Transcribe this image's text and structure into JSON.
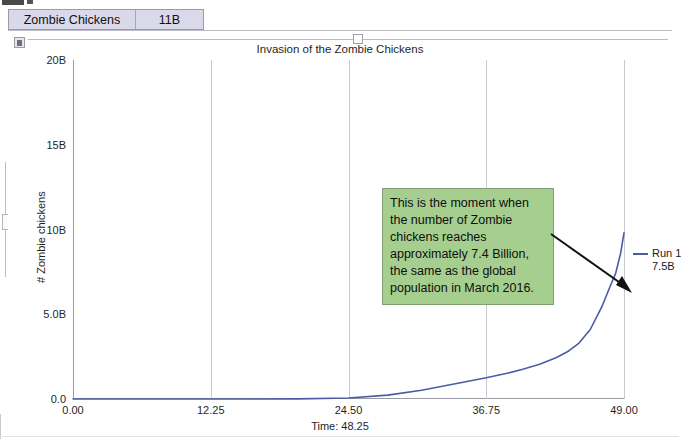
{
  "window": {
    "tabs": [
      {
        "label": "Zombie Chickens",
        "name": "tab-zombie-chickens"
      },
      {
        "label": "11B",
        "name": "tab-11b"
      }
    ]
  },
  "panel": {
    "icon": "window-restore-icon",
    "slider": {
      "name": "horizontal-slider",
      "thumb_position_pct": 50
    },
    "vscroll": {
      "name": "vertical-scrollbar"
    }
  },
  "legend": {
    "series_label": "Run 1",
    "value_label": "7.5B",
    "color": "#4b5ca6"
  },
  "annotation": {
    "text": "This is the moment when the number of Zombie chickens reaches approximately 7.4 Billion, the same as the global population in March 2016.",
    "background": "#a6cf8f",
    "border": "#7f9f72"
  },
  "chart_data": {
    "type": "line",
    "title": "Invasion of the Zombie Chickens",
    "xlabel": "Time: 48.25",
    "ylabel": "# Zombie chickens",
    "xlim": [
      0.0,
      49.0
    ],
    "ylim": [
      0.0,
      20000000000
    ],
    "grid": "vertical-only",
    "legend_position": "right-outside",
    "xticks": [
      "0.00",
      "12.25",
      "24.50",
      "36.75",
      "49.00"
    ],
    "xtick_values": [
      0.0,
      12.25,
      24.5,
      36.75,
      49.0
    ],
    "yticks": [
      "0.0",
      "5.0B",
      "10B",
      "15B",
      "20B"
    ],
    "ytick_values": [
      0,
      5000000000,
      10000000000,
      15000000000,
      20000000000
    ],
    "series": [
      {
        "name": "Run 1",
        "color": "#4b5ca6",
        "x": [
          0.0,
          4.0,
          8.0,
          12.25,
          16.0,
          20.0,
          24.5,
          28.0,
          31.0,
          34.0,
          36.75,
          38.5,
          40.0,
          41.5,
          43.0,
          44.0,
          45.0,
          46.0,
          47.0,
          47.8,
          48.25,
          48.7,
          49.0
        ],
        "y": [
          1000,
          5000,
          30000,
          200000,
          1200000,
          9000000,
          60000000,
          230000000,
          520000000,
          900000000,
          1250000000,
          1500000000,
          1750000000,
          2050000000,
          2450000000,
          2800000000,
          3300000000,
          4100000000,
          5400000000,
          6700000000,
          7400000000,
          8600000000,
          9800000000
        ]
      }
    ],
    "annotation_point": {
      "x": 48.25,
      "y": 7400000000,
      "label": "7.4 Billion"
    }
  }
}
